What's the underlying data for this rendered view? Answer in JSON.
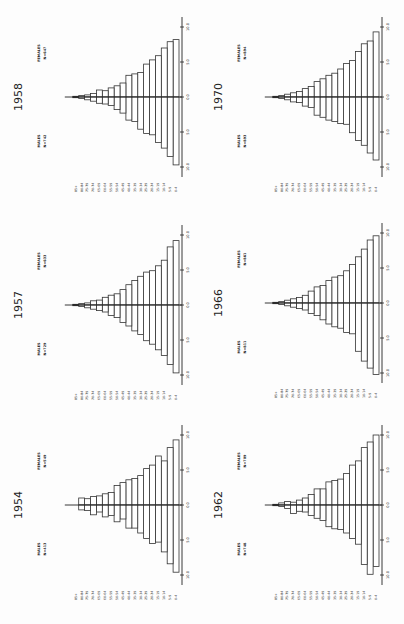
{
  "page": {
    "orientation": "rotated-90-ccw",
    "layout": "3 rows x 2 columns of population pyramids"
  },
  "age_groups": [
    "0-4",
    "5-9",
    "10-14",
    "15-19",
    "20-24",
    "25-29",
    "30-34",
    "35-39",
    "40-44",
    "45-49",
    "50-54",
    "55-59",
    "60-64",
    "65-69",
    "70-74",
    "75-79",
    "80-84",
    "85+"
  ],
  "axis_ticks": [
    "10.0",
    "5.0",
    "0.0",
    "5.0",
    "10.0"
  ],
  "chart_data": [
    {
      "type": "bar",
      "subtype": "population-pyramid",
      "title": "1958",
      "male_label": "MALES",
      "male_n": "N=742",
      "female_label": "FEMALES",
      "female_n": "N=647",
      "xlabel": "",
      "ylabel": "Percent",
      "xlim": [
        -10,
        10
      ],
      "categories": [
        "0-4",
        "5-9",
        "10-14",
        "15-19",
        "20-24",
        "25-29",
        "30-34",
        "35-39",
        "40-44",
        "45-49",
        "50-54",
        "55-59",
        "60-64",
        "65-69",
        "70-74",
        "75-79",
        "80-84",
        "85+"
      ],
      "series": [
        {
          "name": "MALES",
          "values": [
            9.7,
            8.5,
            7.3,
            6.5,
            5.4,
            5.2,
            4.6,
            3.5,
            3.3,
            2.3,
            1.8,
            1.2,
            1.0,
            0.9,
            0.6,
            0.4,
            0.2,
            0.1
          ]
        },
        {
          "name": "FEMALES",
          "values": [
            8.2,
            7.9,
            7.0,
            5.9,
            5.3,
            4.7,
            3.5,
            3.3,
            3.1,
            2.0,
            1.6,
            1.3,
            0.9,
            1.0,
            0.5,
            0.3,
            0.2,
            0.1
          ]
        }
      ]
    },
    {
      "type": "bar",
      "subtype": "population-pyramid",
      "title": "1970",
      "male_label": "MALES",
      "male_n": "N=893",
      "female_label": "FEMALES",
      "female_n": "N=894",
      "xlabel": "",
      "ylabel": "Percent",
      "xlim": [
        -10,
        10
      ],
      "categories": [
        "0-4",
        "5-9",
        "10-14",
        "15-19",
        "20-24",
        "25-29",
        "30-34",
        "35-39",
        "40-44",
        "45-49",
        "50-54",
        "55-59",
        "60-64",
        "65-69",
        "70-74",
        "75-79",
        "80-84",
        "85+"
      ],
      "series": [
        {
          "name": "MALES",
          "values": [
            9.0,
            8.0,
            6.9,
            6.2,
            5.1,
            3.9,
            3.8,
            3.5,
            3.3,
            2.9,
            2.6,
            1.5,
            1.3,
            0.8,
            0.7,
            0.4,
            0.2,
            0.1
          ]
        },
        {
          "name": "FEMALES",
          "values": [
            9.3,
            8.0,
            7.6,
            6.5,
            5.2,
            4.8,
            4.0,
            3.4,
            3.1,
            2.6,
            2.2,
            1.5,
            1.2,
            0.8,
            0.6,
            0.4,
            0.2,
            0.1
          ]
        }
      ]
    },
    {
      "type": "bar",
      "subtype": "population-pyramid",
      "title": "1957",
      "male_label": "MALES",
      "male_n": "N=729",
      "female_label": "FEMALES",
      "female_n": "N=633",
      "xlabel": "",
      "ylabel": "Percent",
      "xlim": [
        -10,
        10
      ],
      "categories": [
        "0-4",
        "5-9",
        "10-14",
        "15-19",
        "20-24",
        "25-29",
        "30-34",
        "35-39",
        "40-44",
        "45-49",
        "50-54",
        "55-59",
        "60-64",
        "65-69",
        "70-74",
        "75-79",
        "80-84",
        "85+"
      ],
      "series": [
        {
          "name": "MALES",
          "values": [
            9.7,
            8.5,
            7.2,
            6.4,
            5.6,
            5.1,
            4.2,
            3.7,
            3.0,
            2.5,
            1.8,
            1.5,
            1.0,
            0.8,
            0.6,
            0.4,
            0.2,
            0.1
          ]
        },
        {
          "name": "FEMALES",
          "values": [
            9.2,
            8.3,
            6.4,
            5.6,
            4.9,
            4.7,
            4.1,
            3.5,
            2.9,
            2.2,
            1.6,
            1.4,
            1.1,
            0.7,
            0.6,
            0.3,
            0.2,
            0.1
          ]
        }
      ]
    },
    {
      "type": "bar",
      "subtype": "population-pyramid",
      "title": "1966",
      "male_label": "MALES",
      "male_n": "N=811",
      "female_label": "FEMALES",
      "female_n": "N=861",
      "xlabel": "",
      "ylabel": "Percent",
      "xlim": [
        -10,
        10
      ],
      "categories": [
        "0-4",
        "5-9",
        "10-14",
        "15-19",
        "20-24",
        "25-29",
        "30-34",
        "35-39",
        "40-44",
        "45-49",
        "50-54",
        "55-59",
        "60-64",
        "65-69",
        "70-74",
        "75-79",
        "80-84",
        "85+"
      ],
      "series": [
        {
          "name": "MALES",
          "values": [
            10.2,
            9.3,
            8.3,
            6.9,
            4.4,
            4.2,
            3.6,
            3.4,
            3.0,
            2.4,
            1.8,
            1.5,
            1.0,
            0.8,
            0.6,
            0.4,
            0.2,
            0.1
          ]
        },
        {
          "name": "FEMALES",
          "values": [
            9.6,
            9.0,
            7.7,
            6.6,
            5.5,
            4.6,
            3.9,
            3.7,
            3.2,
            2.5,
            2.3,
            1.7,
            1.1,
            0.8,
            0.6,
            0.4,
            0.2,
            0.1
          ]
        }
      ]
    },
    {
      "type": "bar",
      "subtype": "population-pyramid",
      "title": "1954",
      "male_label": "MALES",
      "male_n": "N=413",
      "female_label": "FEMALES",
      "female_n": "N=549",
      "xlabel": "",
      "ylabel": "Percent",
      "xlim": [
        -10,
        10
      ],
      "categories": [
        "0-4",
        "5-9",
        "10-14",
        "15-19",
        "20-24",
        "25-29",
        "30-34",
        "35-39",
        "40-44",
        "45-49",
        "50-54",
        "55-59",
        "60-64",
        "65-69",
        "70-74",
        "75-79",
        "80-84",
        "85+"
      ],
      "series": [
        {
          "name": "MALES",
          "values": [
            9.6,
            8.4,
            6.7,
            5.3,
            5.5,
            4.8,
            4.0,
            3.3,
            3.3,
            2.0,
            2.4,
            1.5,
            1.7,
            1.0,
            1.4,
            0.8,
            0.7,
            0.0
          ]
        },
        {
          "name": "FEMALES",
          "values": [
            9.3,
            8.2,
            6.3,
            7.0,
            5.7,
            5.2,
            4.2,
            3.8,
            3.6,
            3.2,
            2.8,
            1.8,
            1.6,
            1.3,
            1.2,
            0.9,
            1.0,
            0.0
          ]
        }
      ]
    },
    {
      "type": "bar",
      "subtype": "population-pyramid",
      "title": "1962",
      "male_label": "MALES",
      "male_n": "N=748",
      "female_label": "FEMALES",
      "female_n": "N=709",
      "xlabel": "",
      "ylabel": "Percent",
      "xlim": [
        -10,
        10
      ],
      "categories": [
        "0-4",
        "5-9",
        "10-14",
        "15-19",
        "20-24",
        "25-29",
        "30-34",
        "35-39",
        "40-44",
        "45-49",
        "50-54",
        "55-59",
        "60-64",
        "65-69",
        "70-74",
        "75-79",
        "80-84",
        "85+"
      ],
      "series": [
        {
          "name": "MALES",
          "values": [
            8.8,
            9.9,
            8.5,
            5.6,
            4.8,
            4.0,
            3.5,
            3.4,
            3.1,
            2.2,
            1.9,
            1.5,
            1.0,
            0.9,
            1.2,
            0.5,
            0.2,
            0.1
          ]
        },
        {
          "name": "FEMALES",
          "values": [
            10.0,
            9.0,
            8.2,
            6.3,
            5.7,
            4.5,
            3.7,
            3.5,
            3.3,
            2.3,
            2.3,
            1.5,
            1.0,
            0.7,
            0.4,
            0.5,
            0.3,
            0.1
          ]
        }
      ]
    }
  ],
  "panels": [
    {
      "chart": 0,
      "col": 0,
      "row": 0,
      "axisX": 179,
      "cy": 97
    },
    {
      "chart": 1,
      "col": 1,
      "row": 0,
      "axisX": 379,
      "cy": 97
    },
    {
      "chart": 2,
      "col": 0,
      "row": 1,
      "axisX": 179,
      "cy": 305
    },
    {
      "chart": 3,
      "col": 1,
      "row": 1,
      "axisX": 379,
      "cy": 303
    },
    {
      "chart": 4,
      "col": 0,
      "row": 2,
      "axisX": 179,
      "cy": 505
    },
    {
      "chart": 5,
      "col": 1,
      "row": 2,
      "axisX": 379,
      "cy": 505
    }
  ]
}
